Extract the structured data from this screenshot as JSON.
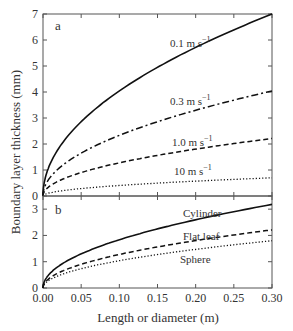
{
  "chart_data": [
    {
      "panel": "a",
      "type": "line",
      "title": "",
      "panel_label": "a",
      "xlabel": "Length or diameter  (m)",
      "ylabel": "Boundary layer thickness  (mm)",
      "xlim": [
        0,
        0.3
      ],
      "ylim": [
        0,
        7
      ],
      "yticks": [
        0,
        1,
        2,
        3,
        4,
        5,
        6,
        7
      ],
      "xticks": [
        0.0,
        0.05,
        0.1,
        0.15,
        0.2,
        0.25,
        0.3
      ],
      "grid": false,
      "legend_position": "inline labels",
      "x": [
        0,
        0.01,
        0.025,
        0.05,
        0.075,
        0.1,
        0.15,
        0.2,
        0.25,
        0.3
      ],
      "series": [
        {
          "name": "0.1 m s-1",
          "label_text": "0.1 m s",
          "style": "solid",
          "values": [
            0,
            1.28,
            2.02,
            2.86,
            3.5,
            4.04,
            4.95,
            5.72,
            6.39,
            7.0
          ]
        },
        {
          "name": "0.3 m s-1",
          "label_text": "0.3 m s",
          "style": "dashdot",
          "values": [
            0,
            0.74,
            1.17,
            1.65,
            2.02,
            2.33,
            2.86,
            3.3,
            3.69,
            4.04
          ]
        },
        {
          "name": "1.0 m s-1",
          "label_text": "1.0 m s",
          "style": "dashed",
          "values": [
            0,
            0.4,
            0.64,
            0.9,
            1.11,
            1.28,
            1.57,
            1.81,
            2.02,
            2.21
          ]
        },
        {
          "name": "10 m s-1",
          "label_text": "10 m s",
          "style": "dotted",
          "values": [
            0,
            0.13,
            0.2,
            0.29,
            0.35,
            0.4,
            0.5,
            0.57,
            0.64,
            0.7
          ]
        }
      ]
    },
    {
      "panel": "b",
      "type": "line",
      "title": "",
      "panel_label": "b",
      "xlabel": "Length or diameter  (m)",
      "ylabel": "Boundary layer thickness  (mm)",
      "xlim": [
        0,
        0.3
      ],
      "ylim": [
        0,
        3.5
      ],
      "yticks": [
        0,
        1,
        2,
        3
      ],
      "xticks": [
        0.0,
        0.05,
        0.1,
        0.15,
        0.2,
        0.25,
        0.3
      ],
      "grid": false,
      "legend_position": "inline labels",
      "x": [
        0,
        0.01,
        0.025,
        0.05,
        0.075,
        0.1,
        0.15,
        0.2,
        0.25,
        0.3
      ],
      "series": [
        {
          "name": "Cylinder",
          "label_text": "Cylinder",
          "style": "solid",
          "values": [
            0,
            0.58,
            0.92,
            1.3,
            1.59,
            1.84,
            2.25,
            2.6,
            2.9,
            3.18
          ]
        },
        {
          "name": "Flat leaf",
          "label_text": "Flat leaf",
          "style": "dashed",
          "values": [
            0,
            0.4,
            0.64,
            0.9,
            1.11,
            1.28,
            1.57,
            1.81,
            2.02,
            2.21
          ]
        },
        {
          "name": "Sphere",
          "label_text": "Sphere",
          "style": "dotted",
          "values": [
            0,
            0.33,
            0.52,
            0.74,
            0.9,
            1.04,
            1.28,
            1.47,
            1.65,
            1.8
          ]
        }
      ]
    }
  ],
  "axes": {
    "xlabel": "Length or diameter  (m)",
    "ylabel": "Boundary layer thickness  (mm)",
    "superscript": "−1"
  }
}
